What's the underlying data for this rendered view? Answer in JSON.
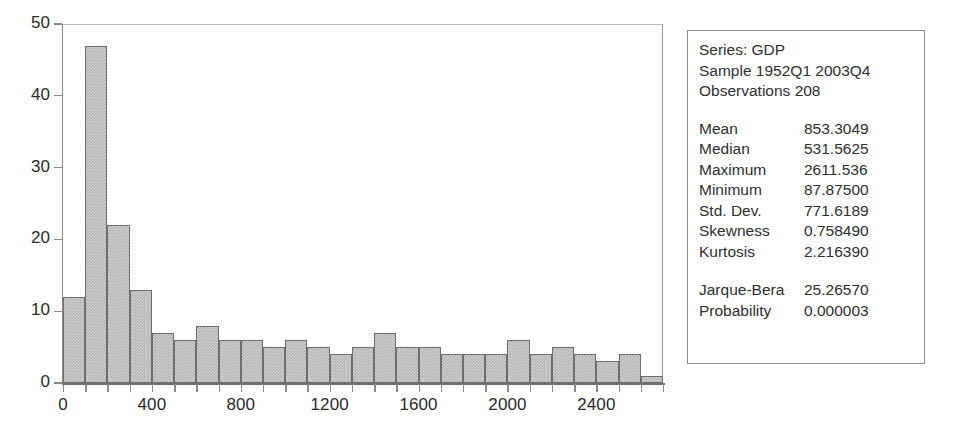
{
  "chart_data": {
    "type": "bar",
    "title": "",
    "xlabel": "",
    "ylabel": "",
    "grid": false,
    "legend": false,
    "xlim": [
      0,
      2700
    ],
    "ylim": [
      0,
      50
    ],
    "y_ticks": [
      0,
      10,
      20,
      30,
      40,
      50
    ],
    "x_ticks": [
      0,
      400,
      800,
      1200,
      1600,
      2000,
      2400
    ],
    "x_tick_labels": [
      "0",
      "400",
      "800",
      "1200",
      "1600",
      "2000",
      "2400"
    ],
    "y_tick_labels": [
      "0",
      "10",
      "20",
      "30",
      "40",
      "50"
    ],
    "bin_width": 100,
    "bin_starts": [
      0,
      100,
      200,
      300,
      400,
      500,
      600,
      700,
      800,
      900,
      1000,
      1100,
      1200,
      1300,
      1400,
      1500,
      1600,
      1700,
      1800,
      1900,
      2000,
      2100,
      2200,
      2300,
      2400,
      2500,
      2600
    ],
    "categories": [
      "0-100",
      "100-200",
      "200-300",
      "300-400",
      "400-500",
      "500-600",
      "600-700",
      "700-800",
      "800-900",
      "900-1000",
      "1000-1100",
      "1100-1200",
      "1200-1300",
      "1300-1400",
      "1400-1500",
      "1500-1600",
      "1600-1700",
      "1700-1800",
      "1800-1900",
      "1900-2000",
      "2000-2100",
      "2100-2200",
      "2200-2300",
      "2300-2400",
      "2400-2500",
      "2500-2600",
      "2600-2700"
    ],
    "values": [
      12,
      47,
      22,
      13,
      7,
      6,
      8,
      6,
      6,
      5,
      6,
      5,
      4,
      5,
      7,
      5,
      5,
      4,
      4,
      4,
      6,
      4,
      5,
      4,
      3,
      4,
      1
    ],
    "bar_color": "#b3b3b3",
    "bar_edge_color": "#6e6e6e"
  },
  "stats": {
    "header": {
      "series": "Series: GDP",
      "sample": "Sample 1952Q1 2003Q4",
      "observations": "Observations 208"
    },
    "rows": [
      {
        "name": "Mean",
        "value": "853.3049"
      },
      {
        "name": "Median",
        "value": "531.5625"
      },
      {
        "name": "Maximum",
        "value": "2611.536"
      },
      {
        "name": "Minimum",
        "value": "87.87500"
      },
      {
        "name": "Std. Dev.",
        "value": "771.6189"
      },
      {
        "name": "Skewness",
        "value": "0.758490"
      },
      {
        "name": "Kurtosis",
        "value": "2.216390"
      }
    ],
    "test_rows": [
      {
        "name": "Jarque-Bera",
        "value": "25.26570"
      },
      {
        "name": "Probability",
        "value": "0.000003"
      }
    ]
  }
}
